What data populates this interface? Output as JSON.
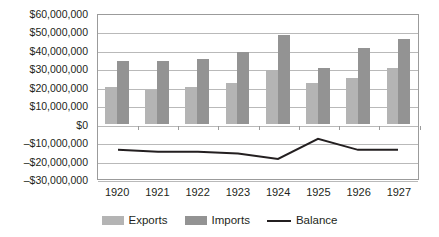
{
  "chart_data": {
    "type": "bar",
    "title": "",
    "xlabel": "",
    "ylabel": "",
    "categories": [
      "1920",
      "1921",
      "1922",
      "1923",
      "1924",
      "1925",
      "1926",
      "1927"
    ],
    "series": [
      {
        "name": "Exports",
        "type": "bar",
        "color": "#b4b4b4",
        "values": [
          20000000,
          18000000,
          20000000,
          22000000,
          29000000,
          22000000,
          25000000,
          30000000
        ]
      },
      {
        "name": "Imports",
        "type": "bar",
        "color": "#939393",
        "values": [
          34000000,
          34000000,
          35000000,
          39000000,
          48000000,
          30000000,
          41000000,
          46000000
        ]
      },
      {
        "name": "Balance",
        "type": "line",
        "color": "#231f20",
        "values": [
          -14000000,
          -15000000,
          -15000000,
          -16000000,
          -19000000,
          -8000000,
          -14000000,
          -14000000
        ]
      }
    ],
    "ylim": [
      -30000000,
      60000000
    ],
    "ytick_values": [
      60000000,
      50000000,
      40000000,
      30000000,
      20000000,
      10000000,
      0,
      -10000000,
      -20000000,
      -30000000
    ],
    "ytick_labels": [
      "$60,000,000",
      "$50,000,000",
      "$40,000,000",
      "$30,000,000",
      "$20,000,000",
      "$10,000,000",
      "$0",
      "–$10,000,000",
      "–$20,000,000",
      "–$30,000,000"
    ],
    "grid": true,
    "legend_position": "bottom",
    "legend": [
      "Exports",
      "Imports",
      "Balance"
    ]
  }
}
